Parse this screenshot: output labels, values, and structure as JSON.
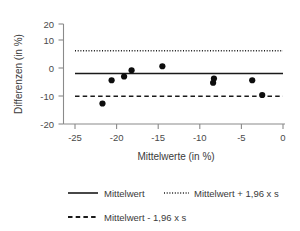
{
  "chart_data": {
    "type": "scatter",
    "title": "",
    "xlabel": "Mittelwerte (in %)",
    "ylabel": "Differenzen (in %)",
    "xlim": [
      -26.5,
      0.5
    ],
    "ylim": [
      -20,
      20
    ],
    "xticks": [
      -25,
      -20,
      -15,
      -10,
      -5,
      0
    ],
    "xtick_labels": [
      "-25",
      "-20",
      "-15",
      "-10",
      "-5",
      "0"
    ],
    "yticks": [
      20,
      10,
      0,
      -10,
      -20
    ],
    "ytick_labels": [
      "20",
      "10",
      "0",
      "-10",
      "-20"
    ],
    "grid": false,
    "legend_position": "bottom",
    "point_color": "#0d0d0d",
    "line_color": "#1a1a1a",
    "axis_color": "#8a8a8a",
    "x": [
      -21.7,
      -20.6,
      -19.1,
      -18.2,
      -14.5,
      -8.4,
      -8.3,
      -3.7,
      -2.5
    ],
    "y": [
      -11.8,
      -2.5,
      -1.0,
      1.5,
      3.1,
      -3.5,
      -1.8,
      -2.5,
      -8.4
    ],
    "points": [
      {
        "x": -21.7,
        "y": -11.8
      },
      {
        "x": -20.6,
        "y": -2.5
      },
      {
        "x": -19.1,
        "y": -1.0
      },
      {
        "x": -18.2,
        "y": 1.5
      },
      {
        "x": -14.5,
        "y": 3.1
      },
      {
        "x": -8.4,
        "y": -3.5
      },
      {
        "x": -8.3,
        "y": -1.8
      },
      {
        "x": -3.7,
        "y": -2.5
      },
      {
        "x": -2.5,
        "y": -8.4
      }
    ],
    "reference_lines": [
      {
        "name": "mean",
        "label": "Mittelwert",
        "value": 0.2,
        "style": "solid"
      },
      {
        "name": "upper_limit",
        "label": "Mittelwert + 1,96 x s",
        "value": 9.3,
        "style": "dotted"
      },
      {
        "name": "lower_limit",
        "label": "Mittelwert - 1,96 x s",
        "value": -8.9,
        "style": "dashed"
      }
    ],
    "legend": [
      {
        "label": "Mittelwert",
        "style": "solid"
      },
      {
        "label": "Mittelwert + 1,96 x s",
        "style": "dotted"
      },
      {
        "label": "Mittelwert - 1,96 x s",
        "style": "dashed"
      }
    ]
  },
  "axes": {
    "y_title": "Differenzen (in %)",
    "x_title": "Mittelwerte (in %)",
    "y_tick_0": "20",
    "y_tick_1": "10",
    "y_tick_2": "0",
    "y_tick_3": "-10",
    "y_tick_4": "-20",
    "x_tick_0": "-25",
    "x_tick_1": "-20",
    "x_tick_2": "-15",
    "x_tick_3": "-10",
    "x_tick_4": "-5",
    "x_tick_5": "0"
  },
  "legend": {
    "mean_label": "Mittelwert",
    "upper_label": "Mittelwert + 1,96 x s",
    "lower_label": "Mittelwert - 1,96 x s"
  }
}
